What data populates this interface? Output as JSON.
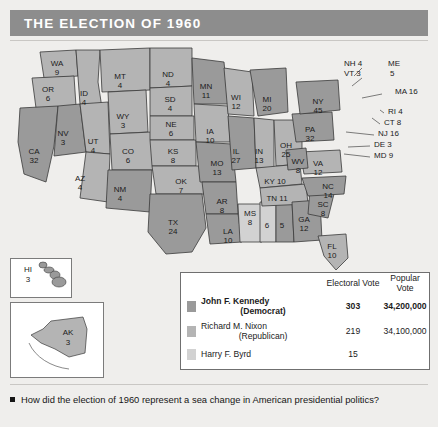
{
  "header": {
    "title": "THE ELECTION OF 1960"
  },
  "colors": {
    "header_bar": "#8d8d8d",
    "kennedy": "#9a9a9a",
    "nixon": "#b4b4b4",
    "byrd": "#d2d2d2",
    "page_bg": "#efeeec",
    "water": "#ffffff",
    "outline": "#3a3a3a"
  },
  "map": {
    "states": [
      {
        "code": "WA",
        "votes": "9",
        "x": 47,
        "y": 22,
        "shade": "nixon"
      },
      {
        "code": "OR",
        "votes": "6",
        "x": 38,
        "y": 48,
        "shade": "nixon"
      },
      {
        "code": "CA",
        "votes": "32",
        "x": 24,
        "y": 110,
        "shade": "kennedy"
      },
      {
        "code": "NV",
        "votes": "3",
        "x": 53,
        "y": 92,
        "shade": "kennedy"
      },
      {
        "code": "ID",
        "votes": "4",
        "x": 74,
        "y": 52,
        "shade": "nixon"
      },
      {
        "code": "UT",
        "votes": "4",
        "x": 83,
        "y": 100,
        "shade": "nixon"
      },
      {
        "code": "AZ",
        "votes": "4",
        "x": 70,
        "y": 137,
        "shade": "nixon"
      },
      {
        "code": "MT",
        "votes": "4",
        "x": 110,
        "y": 35,
        "shade": "nixon"
      },
      {
        "code": "WY",
        "votes": "3",
        "x": 113,
        "y": 75,
        "shade": "nixon"
      },
      {
        "code": "CO",
        "votes": "6",
        "x": 118,
        "y": 110,
        "shade": "nixon"
      },
      {
        "code": "NM",
        "votes": "4",
        "x": 110,
        "y": 148,
        "shade": "kennedy"
      },
      {
        "code": "ND",
        "votes": "4",
        "x": 158,
        "y": 33,
        "shade": "nixon"
      },
      {
        "code": "SD",
        "votes": "4",
        "x": 160,
        "y": 58,
        "shade": "nixon"
      },
      {
        "code": "NE",
        "votes": "6",
        "x": 161,
        "y": 83,
        "shade": "nixon"
      },
      {
        "code": "KS",
        "votes": "8",
        "x": 163,
        "y": 110,
        "shade": "nixon"
      },
      {
        "code": "OK",
        "votes": "7",
        "x": 171,
        "y": 140,
        "shade": "nixon"
      },
      {
        "code": "TX",
        "votes": "24",
        "x": 163,
        "y": 181,
        "shade": "kennedy"
      },
      {
        "code": "MN",
        "votes": "11",
        "x": 196,
        "y": 45,
        "shade": "kennedy"
      },
      {
        "code": "IA",
        "votes": "10",
        "x": 200,
        "y": 90,
        "shade": "nixon"
      },
      {
        "code": "MO",
        "votes": "13",
        "x": 207,
        "y": 122,
        "shade": "kennedy"
      },
      {
        "code": "AR",
        "votes": "8",
        "x": 212,
        "y": 160,
        "shade": "kennedy"
      },
      {
        "code": "LA",
        "votes": "10",
        "x": 218,
        "y": 190,
        "shade": "kennedy"
      },
      {
        "code": "WI",
        "votes": "12",
        "x": 226,
        "y": 56,
        "shade": "nixon"
      },
      {
        "code": "IL",
        "votes": "27",
        "x": 226,
        "y": 110,
        "shade": "kennedy"
      },
      {
        "code": "MS",
        "votes": "8",
        "x": 240,
        "y": 172,
        "shade": "byrd"
      },
      {
        "code": "MI",
        "votes": "20",
        "x": 257,
        "y": 58,
        "shade": "kennedy"
      },
      {
        "code": "IN",
        "votes": "13",
        "x": 249,
        "y": 110,
        "shade": "nixon"
      },
      {
        "code": "AL",
        "votes": "6",
        "x": 257,
        "y": 175,
        "shade": "byrd"
      },
      {
        "code": "AL",
        "votes": "5",
        "x": 272,
        "y": 175,
        "shade": "kennedy"
      },
      {
        "code": "OH",
        "votes": "25",
        "x": 276,
        "y": 104,
        "shade": "nixon"
      },
      {
        "code": "KY",
        "votes": "10",
        "x": 265,
        "y": 140,
        "shade": "nixon"
      },
      {
        "code": "TN",
        "votes": "11",
        "x": 267,
        "y": 157,
        "shade": "nixon"
      },
      {
        "code": "GA",
        "votes": "12",
        "x": 294,
        "y": 178,
        "shade": "kennedy"
      },
      {
        "code": "FL",
        "votes": "10",
        "x": 322,
        "y": 205,
        "shade": "nixon"
      },
      {
        "code": "SC",
        "votes": "8",
        "x": 313,
        "y": 163,
        "shade": "kennedy"
      },
      {
        "code": "NC",
        "votes": "14",
        "x": 318,
        "y": 145,
        "shade": "kennedy"
      },
      {
        "code": "VA",
        "votes": "12",
        "x": 308,
        "y": 122,
        "shade": "nixon"
      },
      {
        "code": "WV",
        "votes": "8",
        "x": 288,
        "y": 120,
        "shade": "kennedy"
      },
      {
        "code": "PA",
        "votes": "32",
        "x": 300,
        "y": 88,
        "shade": "kennedy"
      },
      {
        "code": "NY",
        "votes": "45",
        "x": 308,
        "y": 60,
        "shade": "kennedy"
      }
    ],
    "callouts": [
      {
        "label": "NH 4",
        "x": 334,
        "y": 22
      },
      {
        "label": "VT 3",
        "x": 334,
        "y": 32
      },
      {
        "label": "ME",
        "x": 378,
        "y": 22
      },
      {
        "label": "5",
        "x": 380,
        "y": 32
      },
      {
        "label": "MA 16",
        "x": 385,
        "y": 50
      },
      {
        "label": "RI 4",
        "x": 378,
        "y": 70
      },
      {
        "label": "CT 8",
        "x": 374,
        "y": 81
      },
      {
        "label": "NJ 16",
        "x": 368,
        "y": 92
      },
      {
        "label": "DE 3",
        "x": 364,
        "y": 103
      },
      {
        "label": "MD 9",
        "x": 364,
        "y": 114
      }
    ],
    "insets": [
      {
        "name": "hawaii",
        "code": "HI",
        "votes": "3"
      },
      {
        "name": "alaska",
        "code": "AK",
        "votes": "3"
      }
    ]
  },
  "legend": {
    "columns": {
      "electoral": "Electoral Vote",
      "popular": "Popular Vote"
    },
    "rows": [
      {
        "name": "John F. Kennedy",
        "party": "(Democrat)",
        "electoral": "303",
        "popular": "34,200,000",
        "shade": "kennedy",
        "bold": true
      },
      {
        "name": "Richard M. Nixon",
        "party": "(Republican)",
        "electoral": "219",
        "popular": "34,100,000",
        "shade": "nixon",
        "bold": false
      },
      {
        "name": "Harry F. Byrd",
        "party": "",
        "electoral": "15",
        "popular": "",
        "shade": "byrd",
        "bold": false
      }
    ]
  },
  "footer": {
    "question": "How did the election of 1960 represent a sea change in American presidential politics?"
  }
}
